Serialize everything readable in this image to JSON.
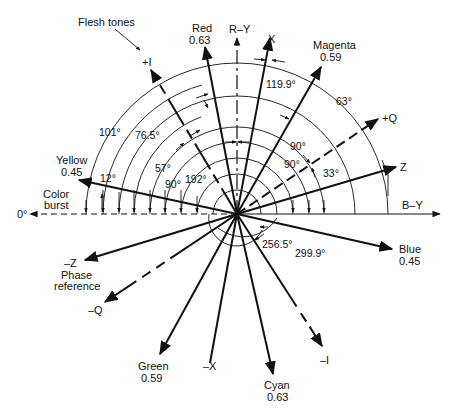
{
  "diagram": {
    "center": [
      237,
      214
    ],
    "ink_color": "#111111",
    "background": "#ffffff"
  },
  "labels": {
    "flesh_tones": "Flesh tones",
    "red": "Red",
    "red_val": "0.63",
    "ry": "R–Y",
    "x": "X",
    "magenta": "Magenta",
    "magenta_val": "0.59",
    "plus_i": "+I",
    "plus_q": "+Q",
    "z": "Z",
    "yellow": "Yellow",
    "yellow_val": "0.45",
    "color_burst_1": "Color",
    "color_burst_2": "burst",
    "zero_deg": "0°",
    "by": "B–Y",
    "blue": "Blue",
    "blue_val": "0.45",
    "minus_z": "–Z",
    "phase_ref_1": "Phase",
    "phase_ref_2": "reference",
    "minus_q": "–Q",
    "green": "Green",
    "green_val": "0.59",
    "minus_x": "–X",
    "cyan": "Cyan",
    "cyan_val": "0.63",
    "minus_i": "–I"
  },
  "angles": {
    "a101": "101°",
    "a76_5": "76.5°",
    "a57": "57°",
    "a12": "12°",
    "a90_left": "90°",
    "a192": "192°",
    "a119_9": "119.9°",
    "a63": "63°",
    "a90_a": "90°",
    "a90_b": "90°",
    "a33": "33°",
    "a256_5": "256.5°",
    "a299_9": "299.9°"
  },
  "vectors": [
    {
      "name": "Color burst",
      "angle_deg": 180,
      "style": "dashed"
    },
    {
      "name": "B-Y",
      "angle_deg": 0,
      "style": "solid"
    },
    {
      "name": "R-Y",
      "angle_deg": 90,
      "style": "solid"
    },
    {
      "name": "Red",
      "angle_deg": 103.5,
      "magnitude": 0.63,
      "style": "solid"
    },
    {
      "name": "X",
      "angle_deg": 79,
      "style": "solid"
    },
    {
      "name": "Magenta",
      "angle_deg": 61,
      "magnitude": 0.59,
      "style": "solid"
    },
    {
      "name": "+Q",
      "angle_deg": 33,
      "style": "dashed"
    },
    {
      "name": "Z",
      "angle_deg": 13,
      "style": "solid"
    },
    {
      "name": "Yellow",
      "angle_deg": 167,
      "magnitude": 0.45,
      "style": "solid"
    },
    {
      "name": "+I",
      "angle_deg": 123,
      "style": "dashed"
    },
    {
      "name": "Blue",
      "angle_deg": 347,
      "magnitude": 0.45,
      "style": "solid"
    },
    {
      "name": "-I",
      "angle_deg": 303,
      "style": "dashed"
    },
    {
      "name": "Cyan",
      "angle_deg": 283.5,
      "magnitude": 0.63,
      "style": "solid"
    },
    {
      "name": "-X",
      "angle_deg": 259,
      "style": "solid"
    },
    {
      "name": "Green",
      "angle_deg": 241,
      "magnitude": 0.59,
      "style": "solid"
    },
    {
      "name": "-Q",
      "angle_deg": 213,
      "style": "dashed"
    },
    {
      "name": "-Z",
      "angle_deg": 193,
      "style": "solid"
    }
  ]
}
